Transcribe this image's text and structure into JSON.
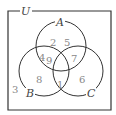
{
  "diagram": {
    "type": "venn",
    "universe_label": "U",
    "sets": [
      {
        "label": "A"
      },
      {
        "label": "B"
      },
      {
        "label": "C"
      }
    ],
    "regions": {
      "A_only": [
        "2",
        "5"
      ],
      "A_and_B_only": "4",
      "A_and_B_and_C": "9",
      "A_and_C_only": "7",
      "B_only": "8",
      "B_and_C_only": "1",
      "C_only": "6",
      "outside": "3"
    },
    "colors": {
      "line": "#333333",
      "text": "#888888"
    }
  }
}
